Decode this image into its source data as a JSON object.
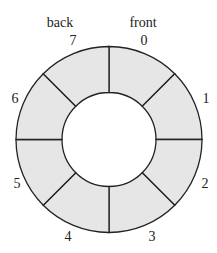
{
  "diagram": {
    "type": "circular-buffer",
    "segments": 8,
    "fill_color": "#e6e6e6",
    "stroke_color": "#222222",
    "slot_labels": [
      "0",
      "1",
      "2",
      "3",
      "4",
      "5",
      "6",
      "7"
    ],
    "pointers": {
      "back": "back",
      "front": "front"
    }
  }
}
